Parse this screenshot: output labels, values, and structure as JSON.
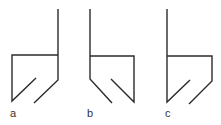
{
  "diagram": {
    "figures": [
      {
        "id": "a",
        "label": "a"
      },
      {
        "id": "b",
        "label": "b"
      },
      {
        "id": "c",
        "label": "c"
      }
    ],
    "colors": {
      "line": "#2b2b2b",
      "label": "#333333",
      "background": "#ffffff"
    }
  }
}
